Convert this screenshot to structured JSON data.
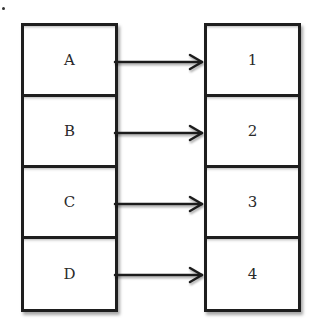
{
  "diagram": {
    "type": "mapping",
    "left_column": {
      "cells": [
        {
          "label": "A"
        },
        {
          "label": "B"
        },
        {
          "label": "C"
        },
        {
          "label": "D"
        }
      ]
    },
    "right_column": {
      "cells": [
        {
          "label": "1"
        },
        {
          "label": "2"
        },
        {
          "label": "3"
        },
        {
          "label": "4"
        }
      ]
    },
    "edges": [
      {
        "from": "A",
        "to": "1"
      },
      {
        "from": "B",
        "to": "2"
      },
      {
        "from": "C",
        "to": "3"
      },
      {
        "from": "D",
        "to": "4"
      }
    ],
    "colors": {
      "stroke": "#1e1e1e",
      "text": "#2a2a2a",
      "background": "#ffffff"
    }
  }
}
